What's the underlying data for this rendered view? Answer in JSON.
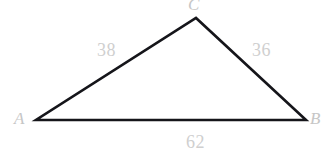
{
  "figure": {
    "type": "triangle",
    "background_color": "#ffffff",
    "stroke_color": "#15151a",
    "stroke_width": 2.6,
    "label_color": "#cccccc",
    "vertices": [
      {
        "name": "A",
        "label": "A",
        "x": 36,
        "y": 120
      },
      {
        "name": "B",
        "label": "B",
        "x": 306,
        "y": 120
      },
      {
        "name": "C",
        "label": "C",
        "x": 196,
        "y": 18
      }
    ],
    "sides": [
      {
        "name": "side-ac",
        "label": "38",
        "from": "A",
        "to": "C"
      },
      {
        "name": "side-bc",
        "label": "36",
        "from": "B",
        "to": "C"
      },
      {
        "name": "side-ab",
        "label": "62",
        "from": "A",
        "to": "B"
      }
    ]
  }
}
